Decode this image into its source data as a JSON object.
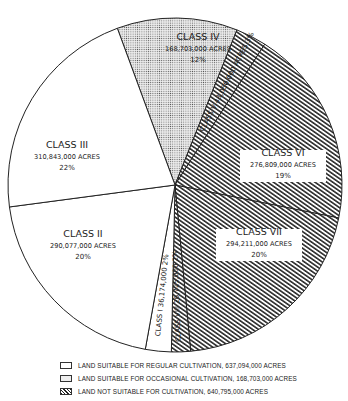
{
  "chart_data": {
    "type": "pie",
    "title": "",
    "unit": "acres",
    "total_acres": 1446592000,
    "slices": [
      {
        "key": "iv",
        "label": "CLASS IV",
        "acres": 168703000,
        "acres_label": "168,703,000 ACRES",
        "percent_label": "12%",
        "pattern": "dots",
        "group": "occasional"
      },
      {
        "key": "v",
        "label": "CLASS V",
        "acres": 43050000,
        "acres_label": "43,050,000 ACRES",
        "percent_label": "3%",
        "pattern": "hatch",
        "group": "not_suitable"
      },
      {
        "key": "vi",
        "label": "CLASS VI",
        "acres": 276809000,
        "acres_label": "276,809,000 ACRES",
        "percent_label": "19%",
        "pattern": "hatch",
        "group": "not_suitable"
      },
      {
        "key": "vii",
        "label": "CLASS VII",
        "acres": 294211000,
        "acres_label": "294,211,000 ACRES",
        "percent_label": "20%",
        "pattern": "hatch",
        "group": "not_suitable"
      },
      {
        "key": "viii",
        "label": "CLASS VIII",
        "acres": 26725000,
        "acres_label": "26,725,000",
        "percent_label": "2%",
        "pattern": "hatch",
        "group": "not_suitable"
      },
      {
        "key": "i",
        "label": "CLASS I",
        "acres": 36174000,
        "acres_label": "36,174,000",
        "percent_label": "2%",
        "pattern": "white",
        "group": "regular"
      },
      {
        "key": "ii",
        "label": "CLASS II",
        "acres": 290077000,
        "acres_label": "290,077,000 ACRES",
        "percent_label": "20%",
        "pattern": "white",
        "group": "regular"
      },
      {
        "key": "iii",
        "label": "CLASS III",
        "acres": 310843000,
        "acres_label": "310,843,000 ACRES",
        "percent_label": "22%",
        "pattern": "white",
        "group": "regular"
      }
    ],
    "start_angle_deg": -20.2,
    "legend": [
      {
        "pattern": "white",
        "text": "LAND SUITABLE FOR REGULAR CULTIVATION, 637,094,000 ACRES"
      },
      {
        "pattern": "dots",
        "text": "LAND SUITABLE FOR OCCASIONAL CULTIVATION, 168,703,000 ACRES"
      },
      {
        "pattern": "hatch",
        "text": "LAND NOT SUITABLE FOR CULTIVATION, 640,795,000 ACRES"
      }
    ],
    "legend_position": "bottom"
  },
  "colors": {
    "ink": "#222222",
    "paper": "#ffffff",
    "dot_fill": "#ececec"
  }
}
